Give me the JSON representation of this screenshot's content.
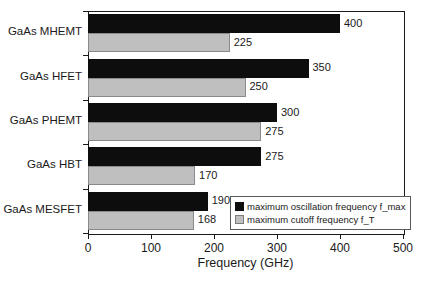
{
  "chart_data": {
    "type": "bar",
    "orientation": "horizontal",
    "title": "",
    "xlabel": "Frequency (GHz)",
    "ylabel": "",
    "xlim": [
      0,
      500
    ],
    "xticks": [
      0,
      100,
      200,
      300,
      400,
      500
    ],
    "grid": false,
    "legend_position": "bottom-right-inside",
    "categories": [
      "GaAs MHEMT",
      "GaAs HFET",
      "GaAs PHEMT",
      "GaAs HBT",
      "GaAs MESFET"
    ],
    "series": [
      {
        "name": "maximum oscillation frequency f_max",
        "color": "#0d0d0d",
        "values": [
          400,
          350,
          300,
          275,
          190
        ]
      },
      {
        "name": "maximum cutoff frequency  f_T",
        "color": "#bfbfbf",
        "values": [
          225,
          250,
          275,
          170,
          168
        ]
      }
    ],
    "data_labels": {
      "f_max": [
        "400",
        "350",
        "300",
        "275",
        "190"
      ],
      "f_T": [
        "225",
        "250",
        "275",
        "170",
        "168"
      ]
    }
  },
  "axis": {
    "x_title": "Frequency (GHz)",
    "tick_labels": [
      "0",
      "100",
      "200",
      "300",
      "400",
      "500"
    ]
  },
  "legend": {
    "entries": [
      {
        "label": "maximum oscillation frequency f_max",
        "swatch": "black-square"
      },
      {
        "label": "maximum cutoff frequency  f_T",
        "swatch": "gray-square"
      }
    ]
  },
  "colors": {
    "f_max": "#0d0d0d",
    "f_T": "#bfbfbf",
    "axis": "#1a1a1a",
    "background": "#ffffff"
  }
}
